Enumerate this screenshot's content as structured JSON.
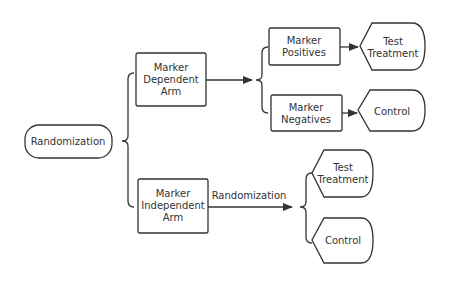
{
  "diagram": {
    "type": "flowchart",
    "stroke_color": "#333333",
    "background": "#ffffff",
    "root": {
      "label": "Randomization"
    },
    "arms": [
      {
        "label_lines": [
          "Marker",
          "Dependent",
          "Arm"
        ],
        "branches": [
          {
            "label_lines": [
              "Marker",
              "Positives"
            ],
            "outcome_lines": [
              "Test",
              "Treatment"
            ]
          },
          {
            "label_lines": [
              "Marker",
              "Negatives"
            ],
            "outcome_lines": [
              "Control"
            ]
          }
        ]
      },
      {
        "label_lines": [
          "Marker",
          "Independent",
          "Arm"
        ],
        "edge_label": "Randomization",
        "outcomes": [
          {
            "label_lines": [
              "Test",
              "Treatment"
            ]
          },
          {
            "label_lines": [
              "Control"
            ]
          }
        ]
      }
    ]
  }
}
